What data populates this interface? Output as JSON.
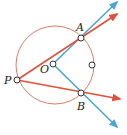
{
  "diagram": {
    "title": "",
    "colors": {
      "circle": "#e07a6a",
      "red_ray": "#e0503a",
      "blue_ray": "#4aa6d6",
      "point_stroke": "#333333",
      "label": "#1a1a1a"
    },
    "circle": {
      "cx": 55,
      "cy": 65,
      "r": 39
    },
    "points": [
      {
        "name": "A",
        "label": "A",
        "x": 81,
        "y": 38,
        "lx": 76,
        "ly": 31
      },
      {
        "name": "O",
        "label": "O",
        "x": 53,
        "y": 64,
        "lx": 40,
        "ly": 73
      },
      {
        "name": "P",
        "label": "P",
        "x": 17,
        "y": 80,
        "lx": 4,
        "ly": 84
      },
      {
        "name": "B",
        "label": "B",
        "x": 81,
        "y": 93,
        "lx": 77,
        "ly": 110
      },
      {
        "name": "unlabeled",
        "label": "",
        "x": 92,
        "y": 65
      }
    ],
    "rays": [
      {
        "name": "ray-OA",
        "color": "blue",
        "x1": 53,
        "y1": 64,
        "x2": 117,
        "y2": 2
      },
      {
        "name": "ray-OB",
        "color": "blue",
        "x1": 53,
        "y1": 64,
        "x2": 117,
        "y2": 127
      },
      {
        "name": "ray-PA",
        "color": "red",
        "x1": 17,
        "y1": 80,
        "x2": 117,
        "y2": 14
      },
      {
        "name": "ray-PB",
        "color": "red",
        "x1": 17,
        "y1": 80,
        "x2": 120,
        "y2": 99
      }
    ]
  }
}
